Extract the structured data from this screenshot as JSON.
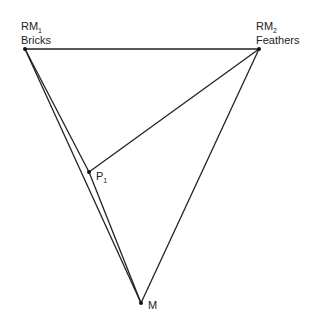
{
  "points": {
    "rm1": {
      "label": "RM",
      "sub": "1",
      "name": "Bricks",
      "x": 25,
      "y": 49
    },
    "rm2": {
      "label": "RM",
      "sub": "2",
      "name": "Feathers",
      "x": 259,
      "y": 49
    },
    "p1": {
      "label": "P",
      "sub": "1",
      "x": 89,
      "y": 172
    },
    "m": {
      "label": "M",
      "x": 141,
      "y": 303
    }
  },
  "colors": {
    "line": "#222222",
    "text": "#222222"
  }
}
